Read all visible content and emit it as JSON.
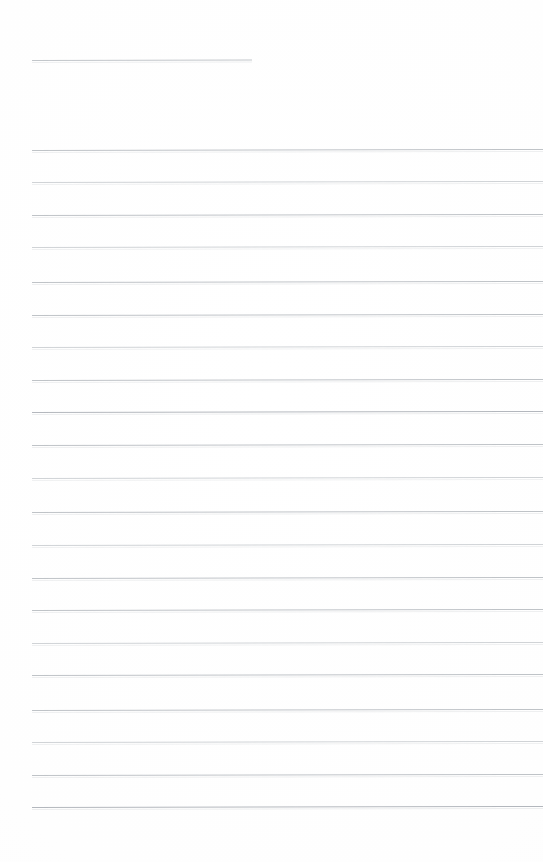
{
  "document": {
    "kind": "scanned-blank-lined-page",
    "page_width": 543,
    "page_height": 862,
    "background_color": "#ffffff",
    "rule_color": "#b9bdc2",
    "text_content": "",
    "visible_text": [],
    "notes": "Blank ruled notebook page scan. No legible text, headings, numbers, labels or icons are present in the pixels."
  },
  "layout": {
    "left_margin_x": 32,
    "right_edge_x": 543,
    "first_rule_y": 150,
    "rule_spacing": 32.5,
    "rule_count": 21,
    "skew_degrees": -0.12
  },
  "header_rule": {
    "label": "short-top-rule",
    "x": 32,
    "y": 60,
    "width": 220,
    "color": "#bcc0c5"
  },
  "rules": [
    {
      "y": 150,
      "x": 32,
      "width": 511,
      "weight": "normal"
    },
    {
      "y": 182,
      "x": 32,
      "width": 511,
      "weight": "faint"
    },
    {
      "y": 215,
      "x": 32,
      "width": 511,
      "weight": "normal"
    },
    {
      "y": 247,
      "x": 32,
      "width": 511,
      "weight": "faint"
    },
    {
      "y": 282,
      "x": 32,
      "width": 511,
      "weight": "normal"
    },
    {
      "y": 315,
      "x": 32,
      "width": 511,
      "weight": "normal"
    },
    {
      "y": 347,
      "x": 32,
      "width": 511,
      "weight": "faint"
    },
    {
      "y": 380,
      "x": 32,
      "width": 511,
      "weight": "normal"
    },
    {
      "y": 412,
      "x": 32,
      "width": 511,
      "weight": "dark"
    },
    {
      "y": 445,
      "x": 32,
      "width": 511,
      "weight": "normal"
    },
    {
      "y": 478,
      "x": 32,
      "width": 511,
      "weight": "faint"
    },
    {
      "y": 512,
      "x": 32,
      "width": 511,
      "weight": "normal"
    },
    {
      "y": 545,
      "x": 32,
      "width": 511,
      "weight": "faint"
    },
    {
      "y": 578,
      "x": 32,
      "width": 511,
      "weight": "normal"
    },
    {
      "y": 610,
      "x": 32,
      "width": 511,
      "weight": "normal"
    },
    {
      "y": 643,
      "x": 32,
      "width": 511,
      "weight": "faint"
    },
    {
      "y": 675,
      "x": 32,
      "width": 511,
      "weight": "normal"
    },
    {
      "y": 710,
      "x": 32,
      "width": 511,
      "weight": "normal"
    },
    {
      "y": 742,
      "x": 32,
      "width": 511,
      "weight": "faint"
    },
    {
      "y": 775,
      "x": 32,
      "width": 511,
      "weight": "normal"
    },
    {
      "y": 807,
      "x": 32,
      "width": 511,
      "weight": "dark"
    }
  ]
}
